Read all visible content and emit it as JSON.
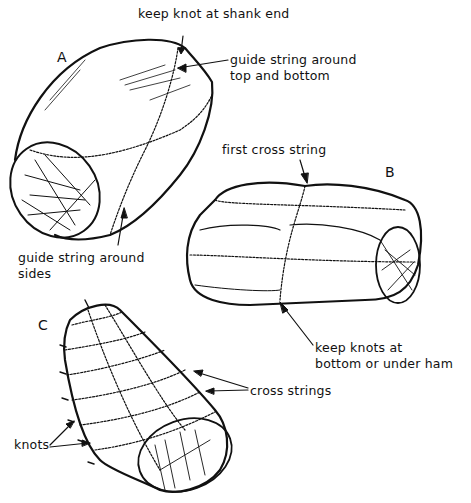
{
  "figure": {
    "panels": [
      {
        "id": "A",
        "label": "A"
      },
      {
        "id": "B",
        "label": "B"
      },
      {
        "id": "C",
        "label": "C"
      }
    ],
    "annotations": {
      "a_knot": "keep knot at shank end",
      "a_guide_top_1": "guide string around",
      "a_guide_top_2": "top and bottom",
      "a_guide_sides_1": "guide string around",
      "a_guide_sides_2": "sides",
      "b_first_cross": "first cross string",
      "b_knots_1": "keep knots at",
      "b_knots_2": "bottom or under ham",
      "c_cross_strings": "cross strings",
      "c_knots": "knots"
    },
    "colors": {
      "ink": "#111111",
      "background": "#ffffff"
    }
  }
}
